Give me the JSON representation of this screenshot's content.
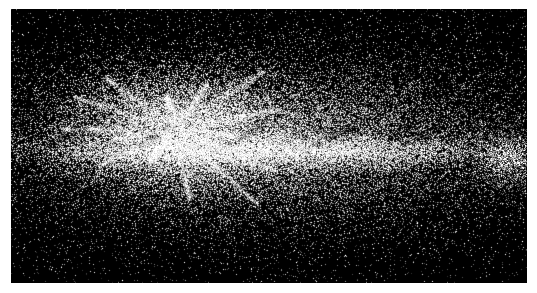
{
  "page": {
    "width": 537,
    "height": 293,
    "background_color": "#ffffff",
    "margin_left": 11,
    "margin_top": 9,
    "margin_right": 10,
    "margin_bottom": 10
  },
  "image_panel": {
    "name": "galaxy-simulation-render",
    "description": "Monochrome edge-on galaxy N-body particle simulation render",
    "x": 11,
    "y": 9,
    "width": 516,
    "height": 274,
    "background_color": "#000000",
    "colormap": "greyscale",
    "has_text_overlay": false,
    "has_axes": false,
    "has_legend": false,
    "has_colorbar": false
  },
  "chart_data": {
    "type": "scatter",
    "title": "",
    "subtitle": "",
    "xlabel": "",
    "ylabel": "",
    "grid": false,
    "legend_position": "none",
    "axis_ticks_visible": false,
    "background_color": "#000000",
    "point_color": "#ffffff",
    "render_mode": "additive-density",
    "particle_count": 42000,
    "xlim": [
      0,
      516
    ],
    "ylim": [
      0,
      274
    ],
    "annotations": [],
    "structure": {
      "center_x": 259,
      "center_y": 131,
      "disk_semi_major_axis": 232,
      "disk_semi_minor_axis": 74,
      "core_x": 168,
      "core_y": 121,
      "core_radius": 62,
      "midplane_y": 142,
      "midplane_thickness": 16,
      "dust_lane_y": 128,
      "dust_lane_thickness": 11,
      "spoke_origin_x": 164,
      "spoke_origin_y": 121,
      "spoke_count": 14,
      "satellite_clump_x": 499,
      "satellite_clump_y": 151,
      "satellite_clump_radius": 22
    },
    "components": [
      {
        "name": "dense-core",
        "center": [
          168,
          121
        ],
        "sigma_x": 58,
        "sigma_y": 30,
        "weight": 0.26,
        "brightness": 1.0
      },
      {
        "name": "inner-disk",
        "center": [
          255,
          133
        ],
        "sigma_x": 112,
        "sigma_y": 34,
        "weight": 0.3,
        "brightness": 0.82
      },
      {
        "name": "extended-disk",
        "center": [
          262,
          136
        ],
        "sigma_x": 176,
        "sigma_y": 52,
        "weight": 0.24,
        "brightness": 0.52
      },
      {
        "name": "diffuse-halo",
        "center": [
          262,
          136
        ],
        "sigma_x": 240,
        "sigma_y": 86,
        "weight": 0.17,
        "brightness": 0.26
      },
      {
        "name": "satellite-clump",
        "center": [
          499,
          151
        ],
        "sigma_x": 20,
        "sigma_y": 16,
        "weight": 0.03,
        "brightness": 0.45
      }
    ]
  }
}
